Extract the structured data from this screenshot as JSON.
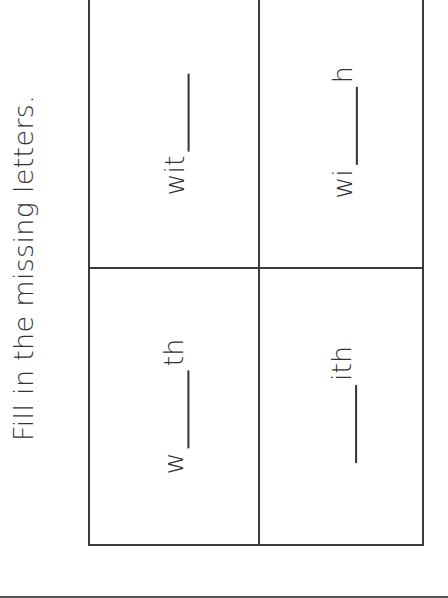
{
  "worksheet": {
    "instruction": "Fill in the missing letters.",
    "cells": [
      {
        "position": "top-left",
        "prefix": "wit",
        "suffix": ""
      },
      {
        "position": "top-right",
        "prefix": "wi",
        "suffix": "h"
      },
      {
        "position": "bottom-left",
        "prefix": "w",
        "suffix": "th"
      },
      {
        "position": "bottom-right",
        "prefix": "",
        "suffix": "ith"
      }
    ]
  },
  "colors": {
    "text": "#333333",
    "lines": "#3a3a3a",
    "background": "#ffffff"
  }
}
